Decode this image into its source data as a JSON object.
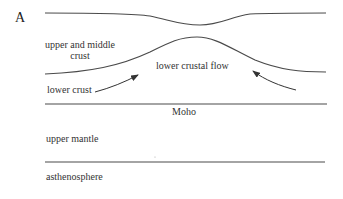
{
  "panel_label": "A",
  "labels": {
    "upper_middle_crust_line1": "upper and middle",
    "upper_middle_crust_line2": "crust",
    "lower_crustal_flow": "lower crustal flow",
    "lower_crust": "lower crust",
    "moho": "Moho",
    "upper_mantle": "upper mantle",
    "asthenosphere": "asthenosphere"
  },
  "colors": {
    "line": "#4a4a4a",
    "text": "#333333"
  }
}
